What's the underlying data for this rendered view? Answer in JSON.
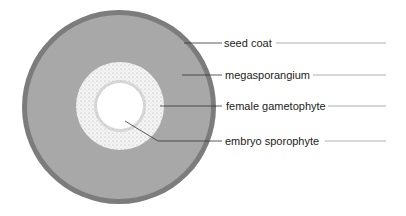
{
  "diagram": {
    "colors": {
      "seed_coat": "#7a7a7a",
      "megasporangium": "#a9a9a9",
      "female_gametophyte": "#f2f2f2",
      "embryo_sporophyte": "#ffffff",
      "leader_line": "#333333"
    },
    "labels": [
      {
        "id": "seed-coat",
        "text": "seed coat"
      },
      {
        "id": "megasporangium",
        "text": "megasporangium"
      },
      {
        "id": "female-gametophyte",
        "text": "female gametophyte"
      },
      {
        "id": "embryo-sporophyte",
        "text": "embryo sporophyte"
      }
    ]
  }
}
